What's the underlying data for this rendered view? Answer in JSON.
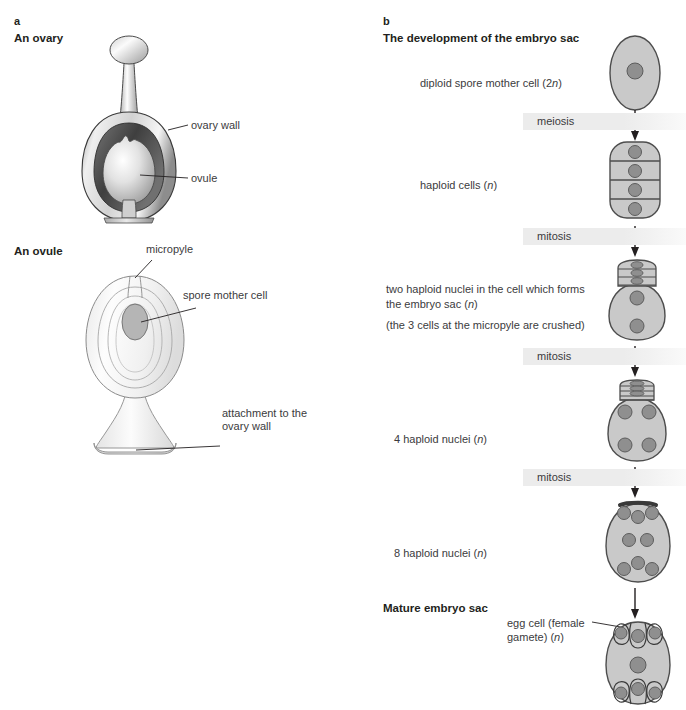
{
  "figure": {
    "panel_a": {
      "letter": "a",
      "title": "An ovary",
      "subtitle": "An ovule",
      "labels": {
        "ovary_wall": "ovary wall",
        "ovule": "ovule",
        "micropyle": "micropyle",
        "spore_mother_cell": "spore mother cell",
        "attachment_line1": "attachment to the",
        "attachment_line2": "ovary wall"
      }
    },
    "panel_b": {
      "letter": "b",
      "title": "The development of the embryo sac",
      "mature_title": "Mature embryo sac",
      "stages": [
        {
          "id": "diploid-spore-mother-cell",
          "label_main": "diploid spore mother cell (2n)",
          "label_note": ""
        },
        {
          "id": "haploid-cells",
          "label_main": "haploid cells (n)",
          "label_note": ""
        },
        {
          "id": "two-haploid-nuclei",
          "label_main": "two haploid nuclei in the cell which forms the embryo sac (n)",
          "label_note": "(the 3 cells at the micropyle are crushed)"
        },
        {
          "id": "four-haploid-nuclei",
          "label_main": "4 haploid nuclei (n)",
          "label_note": ""
        },
        {
          "id": "eight-haploid-nuclei",
          "label_main": "8 haploid nuclei (n)",
          "label_note": ""
        },
        {
          "id": "mature-embryo-sac",
          "label_main": "",
          "label_note": ""
        }
      ],
      "transitions": [
        {
          "id": "meiosis",
          "label": "meiosis"
        },
        {
          "id": "mitosis-1",
          "label": "mitosis"
        },
        {
          "id": "mitosis-2",
          "label": "mitosis"
        },
        {
          "id": "mitosis-3",
          "label": "mitosis"
        }
      ],
      "egg_cell_label_line1": "egg cell (female",
      "egg_cell_label_line2": "gamete) (n)"
    }
  },
  "colors": {
    "text": "#231f20",
    "label_text": "#3b3b3d",
    "band": "#ececec",
    "cell_fill": "#c9c9c9",
    "nucleus_fill": "#8f8f8f",
    "outline": "#3a3a3a",
    "ovary_dark": "#4a4a4a",
    "ovule_light": "#f2f2f2"
  }
}
